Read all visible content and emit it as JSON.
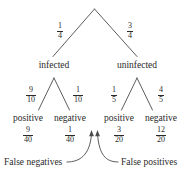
{
  "diagram": {
    "line_color": "#4a4a4a",
    "text_color": "#2a2a2a",
    "background": "#ffffff"
  },
  "root": {
    "branches": [
      {
        "prob_num": "1",
        "prob_den": "4",
        "label": "infected"
      },
      {
        "prob_num": "3",
        "prob_den": "4",
        "label": "uninfected"
      }
    ]
  },
  "level2": {
    "infected": {
      "children": [
        {
          "prob_num": "9",
          "prob_den": "10",
          "label": "positive",
          "joint_num": "9",
          "joint_den": "40"
        },
        {
          "prob_num": "1",
          "prob_den": "10",
          "label": "negative",
          "joint_num": "1",
          "joint_den": "40"
        }
      ]
    },
    "uninfected": {
      "children": [
        {
          "prob_num": "1",
          "prob_den": "5",
          "label": "positive",
          "joint_num": "3",
          "joint_den": "20"
        },
        {
          "prob_num": "4",
          "prob_den": "5",
          "label": "negative",
          "joint_num": "12",
          "joint_den": "20"
        }
      ]
    }
  },
  "annotations": {
    "false_negatives": "False negatives",
    "false_positives": "False positives"
  }
}
